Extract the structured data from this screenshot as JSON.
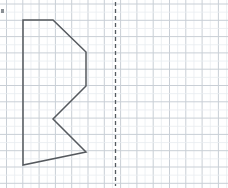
{
  "worksheet": {
    "title": "Grid figure with vertical line of symmetry",
    "width": 228,
    "height": 188,
    "background_color": "#ffffff"
  },
  "grid": {
    "name": "graph-paper-grid",
    "cell_size": 16.3,
    "origin_x": 6.5,
    "origin_y": 4.0,
    "columns": 14,
    "rows": 12,
    "minor_color": "#e9ecf0",
    "major_color": "#c9cfd6",
    "minor_width": 0.8,
    "major_width": 1.0,
    "major_every": 1
  },
  "mirror_line": {
    "name": "line-of-symmetry",
    "orientation": "vertical",
    "x": 115.5,
    "y_start": 2,
    "y_end": 186,
    "color": "#555b60",
    "stroke_width": 1.3,
    "dash_pattern": "4 3",
    "label": "line of symmetry"
  },
  "figure": {
    "name": "polygon-shape",
    "label": "pre-image polygon",
    "stroke_color": "#55595e",
    "stroke_width": 1.5,
    "fill": "none",
    "closed": true,
    "vertex_count": 7,
    "points": [
      {
        "name": "top-left",
        "x": 23,
        "y": 20
      },
      {
        "name": "top-right",
        "x": 53,
        "y": 20
      },
      {
        "name": "upper-bevel-end",
        "x": 86,
        "y": 52
      },
      {
        "name": "right-upper",
        "x": 86,
        "y": 86
      },
      {
        "name": "notch-vertex",
        "x": 53,
        "y": 119
      },
      {
        "name": "right-lower",
        "x": 86,
        "y": 152
      },
      {
        "name": "bottom-left",
        "x": 23,
        "y": 165
      }
    ],
    "points_attr": "23,20 53,20 86,52 86,86 53,119 86,152 23,165"
  },
  "artifacts": [
    {
      "name": "left-edge-mark",
      "x": 1,
      "y": 9,
      "width": 3,
      "height": 4,
      "color": "#8a8f94"
    }
  ]
}
